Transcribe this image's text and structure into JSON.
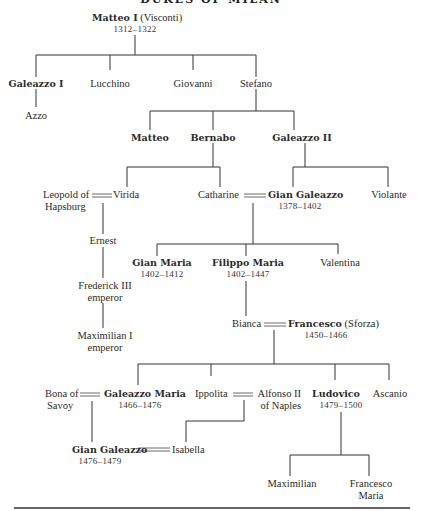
{
  "title": "DUKES OF MILAN",
  "people": {
    "matteo_i": {
      "name": "Matteo I",
      "suffix": "(Visconti)",
      "reign": "1312–1322"
    },
    "galeazzo_i": {
      "name": "Galeazzo I"
    },
    "lucchino": {
      "name": "Lucchino"
    },
    "giovanni": {
      "name": "Giovanni"
    },
    "stefano": {
      "name": "Stefano"
    },
    "azzo": {
      "name": "Azzo"
    },
    "matteo": {
      "name": "Matteo"
    },
    "bernabo": {
      "name": "Bernabo"
    },
    "galeazzo_ii": {
      "name": "Galeazzo II"
    },
    "leopold": {
      "name_line1": "Leopold of",
      "name_line2": "Hapsburg"
    },
    "virida": {
      "name": "Virida"
    },
    "catharine": {
      "name": "Catharine"
    },
    "gian_galeazzo": {
      "name": "Gian Galeazzo",
      "reign": "1378–1402"
    },
    "violante": {
      "name": "Violante"
    },
    "ernest": {
      "name": "Ernest"
    },
    "gian_maria": {
      "name": "Gian Maria",
      "reign": "1402–1412"
    },
    "filippo_maria": {
      "name": "Filippo Maria",
      "reign": "1402–1447"
    },
    "valentina": {
      "name": "Valentina"
    },
    "frederick_iii": {
      "name_line1": "Frederick III",
      "name_line2": "emperor"
    },
    "maximilian_i": {
      "name_line1": "Maximilian I",
      "name_line2": "emperor"
    },
    "bianca": {
      "name": "Bianca"
    },
    "francesco": {
      "name": "Francesco",
      "suffix": "(Sforza)",
      "reign": "1450–1466"
    },
    "bona": {
      "name_line1": "Bona of",
      "name_line2": "Savoy"
    },
    "galeazzo_maria": {
      "name": "Galeazzo Maria",
      "reign": "1466–1476"
    },
    "ippolita": {
      "name": "Ippolita"
    },
    "alfonso_ii": {
      "name_line1": "Alfonso II",
      "name_line2": "of Naples"
    },
    "ludovico": {
      "name": "Ludovico",
      "reign": "1479–1500"
    },
    "ascanio": {
      "name": "Ascanio"
    },
    "gian_galeazzo_2": {
      "name": "Gian Galeazzo",
      "reign": "1476–1479"
    },
    "isabella": {
      "name": "Isabella"
    },
    "maximilian": {
      "name": "Maximilian"
    },
    "francesco_maria": {
      "name_line1": "Francesco",
      "name_line2": "Maria"
    }
  }
}
